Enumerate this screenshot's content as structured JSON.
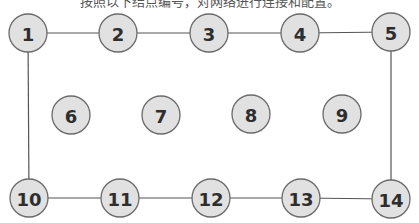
{
  "caption": "按照以下结点编号，对网络进行连接和配置。",
  "diagram": {
    "nodes": [
      {
        "id": "1",
        "label": "1",
        "x": 28,
        "y": 33
      },
      {
        "id": "2",
        "label": "2",
        "x": 118,
        "y": 33
      },
      {
        "id": "3",
        "label": "3",
        "x": 209,
        "y": 33
      },
      {
        "id": "4",
        "label": "4",
        "x": 300,
        "y": 33
      },
      {
        "id": "5",
        "label": "5",
        "x": 391,
        "y": 32
      },
      {
        "id": "6",
        "label": "6",
        "x": 71,
        "y": 115
      },
      {
        "id": "7",
        "label": "7",
        "x": 161,
        "y": 115
      },
      {
        "id": "8",
        "label": "8",
        "x": 251,
        "y": 114
      },
      {
        "id": "9",
        "label": "9",
        "x": 342,
        "y": 114
      },
      {
        "id": "10",
        "label": "10",
        "x": 29,
        "y": 198
      },
      {
        "id": "11",
        "label": "11",
        "x": 120,
        "y": 198
      },
      {
        "id": "12",
        "label": "12",
        "x": 211,
        "y": 198
      },
      {
        "id": "13",
        "label": "13",
        "x": 301,
        "y": 198
      },
      {
        "id": "14",
        "label": "14",
        "x": 391,
        "y": 199
      }
    ],
    "edges": [
      [
        "1",
        "2"
      ],
      [
        "2",
        "3"
      ],
      [
        "3",
        "4"
      ],
      [
        "4",
        "5"
      ],
      [
        "1",
        "10"
      ],
      [
        "5",
        "14"
      ],
      [
        "10",
        "11"
      ],
      [
        "11",
        "12"
      ],
      [
        "12",
        "13"
      ],
      [
        "13",
        "14"
      ]
    ],
    "node_radius": 19,
    "colors": {
      "fill": "#e1e1e1",
      "stroke": "#6a6a6a",
      "edge": "#555555",
      "text": "#2e2e2e"
    }
  }
}
